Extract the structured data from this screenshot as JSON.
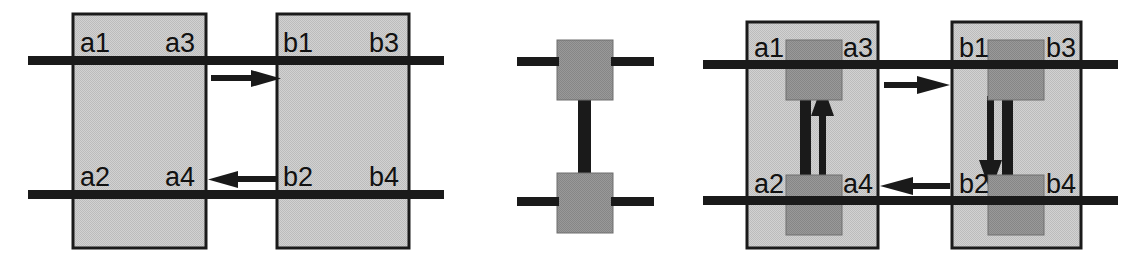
{
  "figure": {
    "type": "block-diagram",
    "background_color": "#ffffff",
    "panel_count": 3,
    "colors": {
      "outline_box_fill": "#c8c8c8",
      "outline_box_stroke": "#1a1a1a",
      "inner_block_fill": "#8f8f8f",
      "inner_block_stroke": "#6e6e6e",
      "wire_color": "#1a1a1a",
      "label_color": "#111111"
    }
  },
  "panels": [
    {
      "id": "panel-left",
      "name": "two-component-interface",
      "blocks": [
        {
          "id": "block-a",
          "ports": [
            {
              "name": "a1",
              "label": "a1",
              "side": "left",
              "row": "top"
            },
            {
              "name": "a3",
              "label": "a3",
              "side": "right",
              "row": "top"
            },
            {
              "name": "a2",
              "label": "a2",
              "side": "left",
              "row": "bottom"
            },
            {
              "name": "a4",
              "label": "a4",
              "side": "right",
              "row": "bottom"
            }
          ]
        },
        {
          "id": "block-b",
          "ports": [
            {
              "name": "b1",
              "label": "b1",
              "side": "left",
              "row": "top"
            },
            {
              "name": "b3",
              "label": "b3",
              "side": "right",
              "row": "top"
            },
            {
              "name": "b2",
              "label": "b2",
              "side": "left",
              "row": "bottom"
            },
            {
              "name": "b4",
              "label": "b4",
              "side": "right",
              "row": "bottom"
            }
          ]
        }
      ],
      "arrows": [
        {
          "name": "arrow-a3-to-b1",
          "direction": "right",
          "row": "top"
        },
        {
          "name": "arrow-b2-to-a4",
          "direction": "left",
          "row": "bottom"
        }
      ]
    },
    {
      "id": "panel-middle",
      "name": "connector-element",
      "blocks": [
        {
          "id": "connector-top",
          "name": "connector-top-block"
        },
        {
          "id": "connector-bottom",
          "name": "connector-bottom-block"
        }
      ],
      "links": [
        {
          "name": "vertical-connector",
          "orientation": "vertical"
        }
      ]
    },
    {
      "id": "panel-right",
      "name": "composed-system",
      "blocks": [
        {
          "id": "block-a-composed",
          "ports": [
            {
              "name": "a1",
              "label": "a1",
              "side": "left",
              "row": "top"
            },
            {
              "name": "a3",
              "label": "a3",
              "side": "right",
              "row": "top"
            },
            {
              "name": "a2",
              "label": "a2",
              "side": "left",
              "row": "bottom"
            },
            {
              "name": "a4",
              "label": "a4",
              "side": "right",
              "row": "bottom"
            }
          ],
          "internal_flow": {
            "name": "flow-up",
            "direction": "up"
          }
        },
        {
          "id": "block-b-composed",
          "ports": [
            {
              "name": "b1",
              "label": "b1",
              "side": "left",
              "row": "top"
            },
            {
              "name": "b3",
              "label": "b3",
              "side": "right",
              "row": "top"
            },
            {
              "name": "b2",
              "label": "b2",
              "side": "left",
              "row": "bottom"
            },
            {
              "name": "b4",
              "label": "b4",
              "side": "right",
              "row": "bottom"
            }
          ],
          "internal_flow": {
            "name": "flow-down",
            "direction": "down"
          }
        }
      ],
      "arrows": [
        {
          "name": "arrow-a3-to-b1",
          "direction": "right",
          "row": "top"
        },
        {
          "name": "arrow-b2-to-a4",
          "direction": "left",
          "row": "bottom"
        }
      ]
    }
  ],
  "labels": {
    "a1": "a1",
    "a2": "a2",
    "a3": "a3",
    "a4": "a4",
    "b1": "b1",
    "b2": "b2",
    "b3": "b3",
    "b4": "b4"
  }
}
